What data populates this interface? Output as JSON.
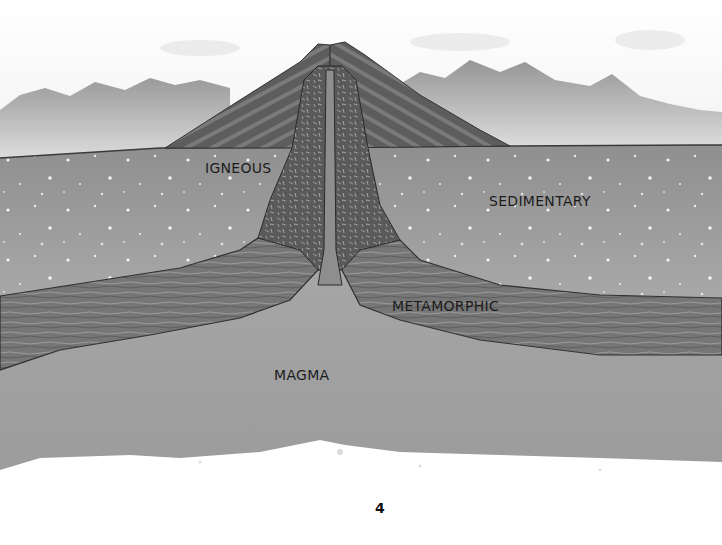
{
  "diagram": {
    "labels": {
      "igneous": "IGNEOUS",
      "sedimentary": "SEDIMENTARY",
      "metamorphic": "METAMORPHIC",
      "magma": "MAGMA"
    },
    "page_number": "4"
  },
  "colors": {
    "sky": "#ffffff",
    "distant_mountains": "#9a9a9a",
    "volcano_cone": "#5a5a5a",
    "igneous_core": "#5e5e5e",
    "sedimentary_layer": "#9c9c9c",
    "metamorphic_layer": "#7a7a7a",
    "magma": "#a6a6a6",
    "outline": "#2a2a2a"
  }
}
